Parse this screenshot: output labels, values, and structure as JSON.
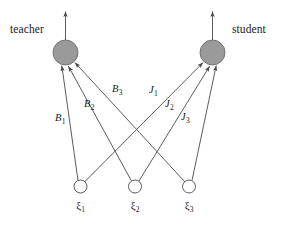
{
  "figure": {
    "type": "neural-network-diagram",
    "background_color": "#ffffff",
    "line_color": "#4a4a4a",
    "hidden_node_fill": "#9a9a9a",
    "hidden_node_stroke": "#555555",
    "input_node_fill": "#ffffff",
    "input_node_stroke": "#4a4a4a"
  },
  "output_units": [
    {
      "id": "teacher",
      "label": "teacher",
      "label_x": 10,
      "label_y": 24,
      "cx": 65.5,
      "cy": 52.5,
      "r": 12.5,
      "filled": true,
      "output_arrow_to_y": 10
    },
    {
      "id": "student",
      "label": "student",
      "label_x": 232,
      "label_y": 24,
      "cx": 212.5,
      "cy": 52.5,
      "r": 12.5,
      "filled": true,
      "output_arrow_to_y": 10
    }
  ],
  "input_units": [
    {
      "id": "xi1",
      "label": "ξ",
      "subscript": "1",
      "cx": 80.5,
      "cy": 186.5,
      "r": 6.5,
      "label_y": 198
    },
    {
      "id": "xi2",
      "label": "ξ",
      "subscript": "2",
      "cx": 135.0,
      "cy": 186.5,
      "r": 6.5,
      "label_y": 198
    },
    {
      "id": "xi3",
      "label": "ξ",
      "subscript": "3",
      "cx": 189.0,
      "cy": 186.5,
      "r": 6.5,
      "label_y": 198
    }
  ],
  "weights": [
    {
      "id": "B1",
      "symbol": "B",
      "subscript": "1",
      "from": "xi1",
      "to": "teacher",
      "x": 55,
      "y": 113
    },
    {
      "id": "B2",
      "symbol": "B",
      "subscript": "2",
      "from": "xi2",
      "to": "teacher",
      "x": 84,
      "y": 99
    },
    {
      "id": "B3",
      "symbol": "B",
      "subscript": "3",
      "from": "xi3",
      "to": "teacher",
      "x": 112,
      "y": 84
    },
    {
      "id": "J1",
      "symbol": "J",
      "subscript": "1",
      "from": "xi1",
      "to": "student",
      "x": 149,
      "y": 85
    },
    {
      "id": "J2",
      "symbol": "J",
      "subscript": "2",
      "from": "xi2",
      "to": "student",
      "x": 165,
      "y": 99
    },
    {
      "id": "J3",
      "symbol": "J",
      "subscript": "3",
      "from": "xi3",
      "to": "student",
      "x": 181,
      "y": 112
    }
  ],
  "edges": [
    {
      "id": "edge-xi1-teacher",
      "x1": 78.0,
      "y1": 180.5,
      "x2": 61.5,
      "y2": 65.0
    },
    {
      "id": "edge-xi2-teacher",
      "x1": 131.5,
      "y1": 181.0,
      "x2": 68.0,
      "y2": 65.5
    },
    {
      "id": "edge-xi3-teacher",
      "x1": 185.0,
      "y1": 182.0,
      "x2": 74.5,
      "y2": 62.0
    },
    {
      "id": "edge-xi1-student",
      "x1": 84.5,
      "y1": 182.0,
      "x2": 203.5,
      "y2": 62.0
    },
    {
      "id": "edge-xi2-student",
      "x1": 139.0,
      "y1": 181.0,
      "x2": 210.0,
      "y2": 65.5
    },
    {
      "id": "edge-xi3-student",
      "x1": 192.0,
      "y1": 180.5,
      "x2": 216.5,
      "y2": 65.0
    }
  ]
}
